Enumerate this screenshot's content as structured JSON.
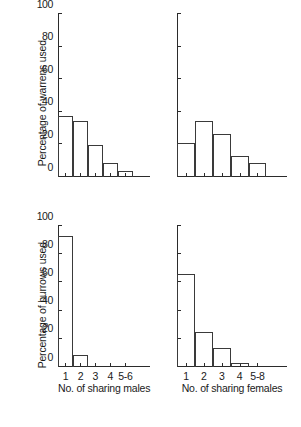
{
  "figure": {
    "background": "#ffffff",
    "ink_color": "#2b2b2b",
    "bar_outline_color": "#3a3a3a"
  },
  "chart_data": [
    {
      "panel": "top-left",
      "type": "bar",
      "title": "",
      "xlabel": "No. of sharing males",
      "ylabel": "Percentage of warrens used",
      "categories": [
        "1",
        "2",
        "3",
        "4",
        "5-6"
      ],
      "values": [
        37,
        34,
        19,
        8,
        3
      ],
      "ylim": [
        0,
        100
      ],
      "yticks": [
        0,
        20,
        40,
        60,
        80,
        100
      ],
      "ytick_labels": [
        "0",
        "20",
        "40",
        "60",
        "80",
        "100"
      ],
      "show_ytick_labels": true,
      "show_xtick_labels": false,
      "show_xlabel": false,
      "show_ylabel": true,
      "grid": false,
      "legend": null
    },
    {
      "panel": "top-right",
      "type": "bar",
      "title": "",
      "xlabel": "No. of sharing females",
      "ylabel": "Percentage of warrens used",
      "categories": [
        "1",
        "2",
        "3",
        "4",
        "5-8"
      ],
      "values": [
        20,
        34,
        26,
        12,
        8
      ],
      "ylim": [
        0,
        100
      ],
      "yticks": [
        0,
        20,
        40,
        60,
        80,
        100
      ],
      "ytick_labels": [
        "",
        "",
        "",
        "",
        "",
        ""
      ],
      "show_ytick_labels": false,
      "show_xtick_labels": false,
      "show_xlabel": false,
      "show_ylabel": false,
      "grid": false,
      "legend": null
    },
    {
      "panel": "bottom-left",
      "type": "bar",
      "title": "",
      "xlabel": "No. of sharing males",
      "ylabel": "Percentage of burrows used",
      "categories": [
        "1",
        "2",
        "3",
        "4",
        "5-6"
      ],
      "values": [
        92,
        8,
        0,
        0,
        0
      ],
      "ylim": [
        0,
        100
      ],
      "yticks": [
        0,
        20,
        40,
        60,
        80,
        100
      ],
      "ytick_labels": [
        "0",
        "20",
        "40",
        "60",
        "80",
        "100"
      ],
      "show_ytick_labels": true,
      "show_xtick_labels": true,
      "show_xlabel": true,
      "show_ylabel": true,
      "grid": false,
      "legend": null
    },
    {
      "panel": "bottom-right",
      "type": "bar",
      "title": "",
      "xlabel": "No. of sharing females",
      "ylabel": "Percentage of burrows used",
      "categories": [
        "1",
        "2",
        "3",
        "4",
        "5-8"
      ],
      "values": [
        65,
        24,
        13,
        2,
        0
      ],
      "ylim": [
        0,
        100
      ],
      "yticks": [
        0,
        20,
        40,
        60,
        80,
        100
      ],
      "ytick_labels": [
        "",
        "",
        "",
        "",
        "",
        ""
      ],
      "show_ytick_labels": false,
      "show_xtick_labels": true,
      "show_xlabel": true,
      "show_ylabel": false,
      "grid": false,
      "legend": null
    }
  ],
  "labels": {
    "y_warrens": "Percentage of warrens used",
    "y_burrows": "Percentage of burrows used",
    "x_males": "No. of sharing males",
    "x_females": "No. of sharing females",
    "y_0": "0",
    "y_20": "20",
    "y_40": "40",
    "y_60": "60",
    "y_80": "80",
    "y_100": "100",
    "x_males_ticks": [
      "1",
      "2",
      "3",
      "4",
      "5-6"
    ],
    "x_females_ticks": [
      "1",
      "2",
      "3",
      "4",
      "5-8"
    ]
  }
}
